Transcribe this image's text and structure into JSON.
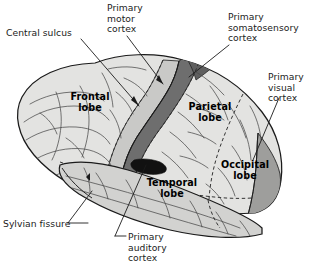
{
  "figure": {
    "background_color": "#ffffff",
    "width": 313,
    "height": 270
  },
  "callouts": [
    {
      "id": "central-sulcus",
      "label": "Central sulcus"
    },
    {
      "id": "primary-motor",
      "label": "Primary\nmotor\ncortex"
    },
    {
      "id": "primary-somato",
      "label": "Primary\nsomatosensory\ncortex"
    },
    {
      "id": "primary-visual",
      "label": "Primary\nvisual\ncortex"
    },
    {
      "id": "sylvian-fissure",
      "label": "Sylvian fissure"
    },
    {
      "id": "primary-auditory",
      "label": "Primary\nauditory\ncortex"
    }
  ],
  "lobes": [
    {
      "id": "frontal",
      "label": "Frontal\nlobe"
    },
    {
      "id": "parietal",
      "label": "Parietal\nlobe"
    },
    {
      "id": "temporal",
      "label": "Temporal\nlobe"
    },
    {
      "id": "occipital",
      "label": "Occipital\nlobe"
    }
  ],
  "colors": {
    "cortex_fill": "#e3e3e1",
    "temporal_fill": "#d2d2d0",
    "motor_strip": "#c9c9c7",
    "somatosensory_strip": "#6e6e6e",
    "visual_cortex": "#9e9e9c",
    "auditory_cortex": "#111111",
    "outline": "#1b1b1b",
    "sulci": "#444444",
    "leader_line": "#1b1b1b",
    "text": "#1b1b1b"
  }
}
